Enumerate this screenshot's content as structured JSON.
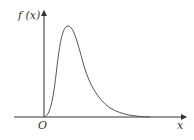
{
  "diagram": {
    "y_axis_label": "f (x)",
    "x_axis_label": "x",
    "origin_label": "O",
    "curve_color": "#555555",
    "axis_color": "#333333"
  }
}
